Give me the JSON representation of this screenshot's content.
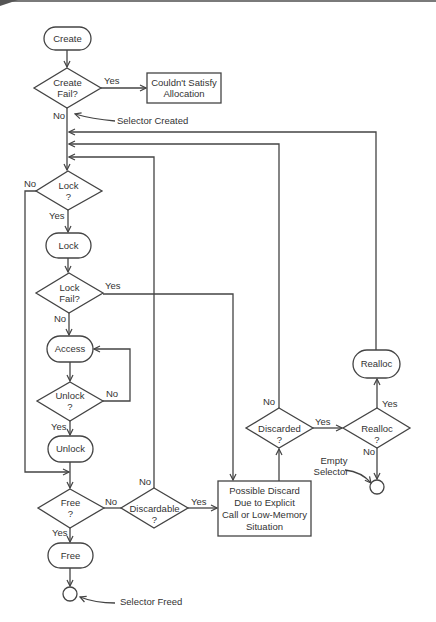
{
  "diagram": {
    "nodes": {
      "create": "Create",
      "create_fail": [
        "Create",
        "Fail?"
      ],
      "couldnt_satisfy": [
        "Couldn't Satisfy",
        "Allocation"
      ],
      "lock_q": [
        "Lock",
        "?"
      ],
      "lock": "Lock",
      "lock_fail": [
        "Lock",
        "Fail?"
      ],
      "access": "Access",
      "unlock_q": [
        "Unlock",
        "?"
      ],
      "unlock": "Unlock",
      "free_q": [
        "Free",
        "?"
      ],
      "free": "Free",
      "discardable_q": [
        "Discardable",
        "?"
      ],
      "possible_discard": [
        "Possible Discard",
        "Due to Explicit",
        "Call or Low-Memory",
        "Situation"
      ],
      "discarded_q": [
        "Discarded",
        "?"
      ],
      "realloc_q": [
        "Realloc",
        "?"
      ],
      "realloc": "Realloc"
    },
    "edge_labels": {
      "yes": "Yes",
      "no": "No"
    },
    "annotations": {
      "selector_created": "Selector Created",
      "selector_freed": "Selector Freed",
      "empty_selector": [
        "Empty",
        "Selector"
      ]
    }
  }
}
